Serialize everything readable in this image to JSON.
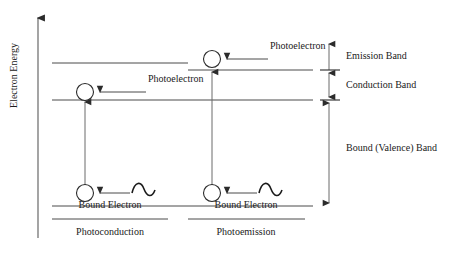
{
  "figure": {
    "background_color": "#ffffff",
    "stroke_color": "#3a3a3a",
    "text_color": "#1a1a1a",
    "axis": {
      "label": "Electron Energy",
      "direction": "up"
    }
  },
  "panels": [
    {
      "id": "photoconduction",
      "caption": "Photoconduction",
      "photoelectron_label": "Photoelectron",
      "bound_electron_label": "Bound Electron",
      "excited_state_position": "conduction-band-edge",
      "photon_symbol": "sine-wave"
    },
    {
      "id": "photoemission",
      "caption": "Photoemission",
      "photoelectron_label": "Photoelectron",
      "bound_electron_label": "Bound Electron",
      "excited_state_position": "above-emission-band",
      "photon_symbol": "sine-wave"
    }
  ],
  "bands": [
    {
      "id": "emission",
      "label": "Emission Band"
    },
    {
      "id": "conduction",
      "label": "Conduction Band"
    },
    {
      "id": "valence",
      "label": "Bound (Valence) Band"
    }
  ]
}
